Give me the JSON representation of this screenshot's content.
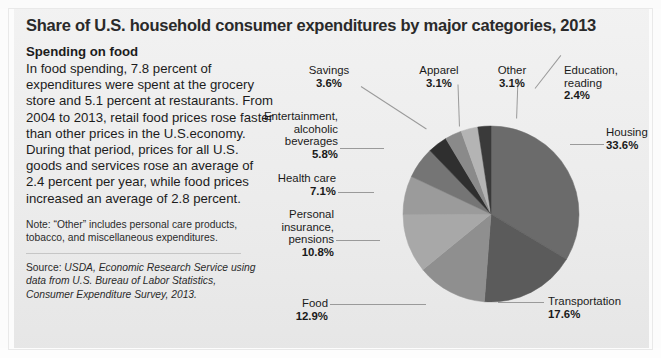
{
  "title": "Share of U.S. household consumer expenditures by major categories, 2013",
  "left_panel": {
    "subhead": "Spending on food",
    "body": "In food spending, 7.8 percent of expenditures were spent at the grocery store and 5.1 percent at restaurants.  From 2004 to 2013, retail food prices rose faster than other prices in the U.S.economy. During that period, prices for all U.S. goods and services rose an average of 2.4 percent per year, while food prices increased an average of 2.8 percent.",
    "note": "Note: “Other” includes personal care products, tobacco, and miscellaneous expenditures.",
    "source_label": "Source: ",
    "source_italic": "USDA, Economic Research Service using data from U.S. Bureau of Labor Statistics, Consumer Expenditure Survey, 2013."
  },
  "chart_data": {
    "type": "pie",
    "title": "Share of U.S. household consumer expenditures by major categories, 2013",
    "unit": "percent",
    "legend": "labels-with-leader-lines",
    "categories": [
      "Housing",
      "Transportation",
      "Food",
      "Personal insurance, pensions",
      "Health care",
      "Entertainment, alcoholic beverages",
      "Savings",
      "Apparel",
      "Other",
      "Education, reading"
    ],
    "values": [
      33.6,
      17.6,
      12.9,
      10.8,
      7.1,
      5.8,
      3.6,
      3.1,
      3.1,
      2.4
    ],
    "value_labels": [
      "33.6%",
      "17.6%",
      "12.9%",
      "10.8%",
      "7.1%",
      "5.8%",
      "3.6%",
      "3.1%",
      "3.1%",
      "2.4%"
    ],
    "colors": [
      "#6b6b6b",
      "#5b5b5b",
      "#8f8f8f",
      "#a8a8a8",
      "#9b9b9b",
      "#757575",
      "#2f2f2f",
      "#8a8a8a",
      "#b4b4b4",
      "#3a3a3a"
    ],
    "start_angle_deg": 0,
    "direction": "clockwise"
  },
  "slices": {
    "housing": {
      "name": "Housing",
      "pct": "33.6%"
    },
    "transportation": {
      "name": "Transportation",
      "pct": "17.6%"
    },
    "food": {
      "name": "Food",
      "pct": "12.9%"
    },
    "insurance": {
      "l1": "Personal",
      "l2": "insurance,",
      "l3": "pensions",
      "pct": "10.8%"
    },
    "health": {
      "name": "Health care",
      "pct": "7.1%"
    },
    "entertainment": {
      "l1": "Entertainment,",
      "l2": "alcoholic",
      "l3": "beverages",
      "pct": "5.8%"
    },
    "savings": {
      "name": "Savings",
      "pct": "3.6%"
    },
    "apparel": {
      "name": "Apparel",
      "pct": "3.1%"
    },
    "other": {
      "name": "Other",
      "pct": "3.1%"
    },
    "education": {
      "l1": "Education,",
      "l2": "reading",
      "pct": "2.4%"
    }
  }
}
